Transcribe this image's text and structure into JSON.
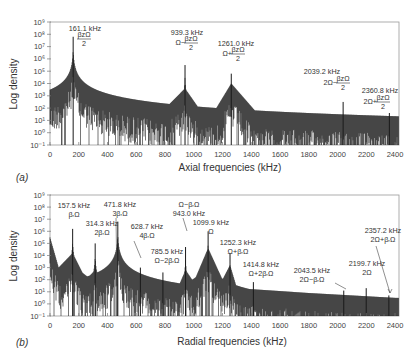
{
  "chart_data": [
    {
      "type": "line",
      "panel_label": "(a)",
      "title": "",
      "xlabel": "Axial frequencies (kHz)",
      "ylabel": "Log density",
      "xlim": [
        0,
        2400
      ],
      "ylim_log10": [
        -1,
        9
      ],
      "x_ticks": [
        0,
        200,
        400,
        600,
        800,
        1000,
        1200,
        1400,
        1600,
        1800,
        2000,
        2200,
        2400
      ],
      "y_ticks": [
        "10^-1",
        "10^0",
        "10^1",
        "10^2",
        "10^3",
        "10^4",
        "10^5",
        "10^6",
        "10^7",
        "10^8",
        "10^9"
      ],
      "grid": false,
      "peaks": [
        {
          "freq_khz": 161.1,
          "label": "161.1 kHz",
          "expr": "βzΩ/2",
          "peak_log": 7.8
        },
        {
          "freq_khz": 939.3,
          "label": "939.3 kHz",
          "expr": "Ω−βzΩ/2",
          "peak_log": 5.5
        },
        {
          "freq_khz": 1261.0,
          "label": "1261.0 kHz",
          "expr": "Ω+βzΩ/2",
          "peak_log": 4.8
        },
        {
          "freq_khz": 2039.2,
          "label": "2039.2 kHz",
          "expr": "2Ω−βzΩ/2",
          "peak_log": 2.5
        },
        {
          "freq_khz": 2360.8,
          "label": "2360.8 kHz",
          "expr": "2Ω+βzΩ/2",
          "peak_log": 1.6
        }
      ],
      "baseline_envelope": [
        {
          "x": 0,
          "log": 2.2
        },
        {
          "x": 161.1,
          "log": 4.5
        },
        {
          "x": 400,
          "log": 1.6
        },
        {
          "x": 700,
          "log": 0.8
        },
        {
          "x": 939.3,
          "log": 3.6
        },
        {
          "x": 1100,
          "log": 0.9
        },
        {
          "x": 1261.0,
          "log": 4.0
        },
        {
          "x": 1500,
          "log": 0.8
        },
        {
          "x": 2000,
          "log": 0.1
        },
        {
          "x": 2039.2,
          "log": 1.2
        },
        {
          "x": 2060,
          "log": -0.3
        },
        {
          "x": 2400,
          "log": -0.5
        }
      ]
    },
    {
      "type": "line",
      "panel_label": "(b)",
      "title": "",
      "xlabel": "Radial frequencies (kHz)",
      "ylabel": "Log density",
      "xlim": [
        0,
        2400
      ],
      "ylim_log10": [
        -1,
        9
      ],
      "x_ticks": [
        0,
        200,
        400,
        600,
        800,
        1000,
        1200,
        1400,
        1600,
        1800,
        2000,
        2200,
        2400
      ],
      "y_ticks": [
        "10^-1",
        "10^0",
        "10^1",
        "10^2",
        "10^3",
        "10^4",
        "10^5",
        "10^6",
        "10^7",
        "10^8",
        "10^9"
      ],
      "grid": false,
      "peaks": [
        {
          "freq_khz": 157.5,
          "label": "157.5 kHz",
          "expr": "βrΩ",
          "peak_log": 6.2
        },
        {
          "freq_khz": 314.3,
          "label": "314.3 kHz",
          "expr": "2βrΩ",
          "peak_log": 5.0
        },
        {
          "freq_khz": 471.8,
          "label": "471.8 kHz",
          "expr": "3βrΩ",
          "peak_log": 6.8
        },
        {
          "freq_khz": 628.7,
          "label": "628.7 kHz",
          "expr": "4βrΩ",
          "peak_log": 3.0
        },
        {
          "freq_khz": 785.5,
          "label": "785.5 kHz",
          "expr": "Ω−2βrΩ",
          "peak_log": 2.6
        },
        {
          "freq_khz": 943.0,
          "label": "943.0 kHz",
          "expr": "Ω−βrΩ",
          "peak_log": 4.7
        },
        {
          "freq_khz": 1099.9,
          "label": "1099.9 kHz",
          "expr": "Ω",
          "peak_log": 6.0
        },
        {
          "freq_khz": 1252.3,
          "label": "1252.3 kHz",
          "expr": "Ω+βrΩ",
          "peak_log": 4.2
        },
        {
          "freq_khz": 1414.8,
          "label": "1414.8 kHz",
          "expr": "Ω+2βrΩ",
          "peak_log": 1.8
        },
        {
          "freq_khz": 2043.5,
          "label": "2043.5 kHz",
          "expr": "2Ω−βrΩ",
          "peak_log": 1.1
        },
        {
          "freq_khz": 2199.7,
          "label": "2199.7 kHz",
          "expr": "2Ω",
          "peak_log": 1.3
        },
        {
          "freq_khz": 2357.2,
          "label": "2357.2 kHz",
          "expr": "2Ω+βrΩ",
          "peak_log": 0.7
        }
      ],
      "baseline_envelope": [
        {
          "x": 0,
          "log": 5.5
        },
        {
          "x": 60,
          "log": 3.0
        },
        {
          "x": 157.5,
          "log": 4.2
        },
        {
          "x": 250,
          "log": 2.0
        },
        {
          "x": 314.3,
          "log": 2.8
        },
        {
          "x": 400,
          "log": 1.8
        },
        {
          "x": 471.8,
          "log": 2.2
        },
        {
          "x": 600,
          "log": 1.6
        },
        {
          "x": 785.5,
          "log": 1.8
        },
        {
          "x": 900,
          "log": 1.6
        },
        {
          "x": 943.0,
          "log": 2.8
        },
        {
          "x": 1000,
          "log": 1.8
        },
        {
          "x": 1099.9,
          "log": 4.6
        },
        {
          "x": 1200,
          "log": 2.0
        },
        {
          "x": 1252.3,
          "log": 3.2
        },
        {
          "x": 1300,
          "log": 1.3
        },
        {
          "x": 1800,
          "log": 0.9
        },
        {
          "x": 2400,
          "log": 0.5
        }
      ]
    }
  ],
  "panels": {
    "a": {
      "label": "(a)",
      "xlabel": "Axial frequencies (kHz)",
      "ylabel": "Log density"
    },
    "b": {
      "label": "(b)",
      "xlabel": "Radial frequencies (kHz)",
      "ylabel": "Log density"
    }
  },
  "colors": {
    "trace": "#1a1a1a",
    "frame": "#8a8a8a",
    "text": "#333333"
  }
}
